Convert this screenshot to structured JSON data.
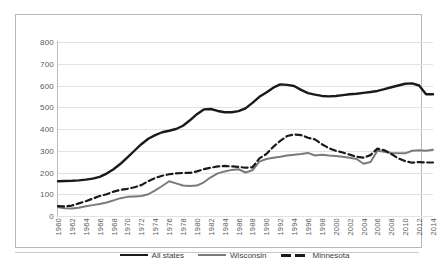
{
  "chart_data": {
    "type": "line",
    "title": "",
    "subtitle": "",
    "xlabel": "",
    "ylabel": "",
    "ylim": [
      0,
      800
    ],
    "xlim": [
      1960,
      2014
    ],
    "grid": true,
    "legend_position": "bottom",
    "y_ticks": [
      "0",
      "100",
      "200",
      "300",
      "400",
      "500",
      "600",
      "700",
      "800"
    ],
    "y_tick_values": [
      0,
      100,
      200,
      300,
      400,
      500,
      600,
      700,
      800
    ],
    "categories": [
      "1960",
      "1961",
      "1962",
      "1963",
      "1964",
      "1965",
      "1966",
      "1967",
      "1968",
      "1969",
      "1970",
      "1971",
      "1972",
      "1973",
      "1974",
      "1975",
      "1976",
      "1977",
      "1978",
      "1979",
      "1980",
      "1981",
      "1982",
      "1983",
      "1984",
      "1985",
      "1986",
      "1987",
      "1988",
      "1989",
      "1990",
      "1991",
      "1992",
      "1993",
      "1994",
      "1995",
      "1996",
      "1997",
      "1998",
      "1999",
      "2000",
      "2001",
      "2002",
      "2003",
      "2004",
      "2005",
      "2006",
      "2007",
      "2008",
      "2009",
      "2010",
      "2011",
      "2012",
      "2013",
      "2014"
    ],
    "x_tick_labels": [
      "1960",
      "1962",
      "1964",
      "1966",
      "1968",
      "1970",
      "1972",
      "1974",
      "1976",
      "1978",
      "1980",
      "1982",
      "1984",
      "1986",
      "1988",
      "1990",
      "1992",
      "1994",
      "1996",
      "1998",
      "2000",
      "2002",
      "2004",
      "2006",
      "2008",
      "2010",
      "2012",
      "2014"
    ],
    "series": [
      {
        "name": "All states",
        "color": "#1a1a1a",
        "style": "solid",
        "width": 2.4,
        "values": [
          160,
          161,
          162,
          164,
          167,
          172,
          180,
          195,
          215,
          240,
          270,
          300,
          330,
          355,
          372,
          385,
          392,
          400,
          415,
          440,
          468,
          490,
          492,
          483,
          477,
          477,
          482,
          495,
          520,
          548,
          568,
          590,
          605,
          603,
          598,
          580,
          565,
          558,
          552,
          550,
          552,
          556,
          560,
          562,
          566,
          570,
          575,
          583,
          592,
          600,
          608,
          610,
          600,
          560,
          560
        ]
      },
      {
        "name": "Wisconsin",
        "color": "#7a7a7a",
        "style": "solid",
        "width": 2,
        "values": [
          40,
          36,
          34,
          38,
          45,
          50,
          55,
          62,
          72,
          82,
          88,
          90,
          92,
          100,
          118,
          138,
          160,
          150,
          140,
          138,
          140,
          155,
          178,
          196,
          205,
          212,
          215,
          200,
          210,
          250,
          262,
          268,
          272,
          278,
          282,
          285,
          290,
          278,
          282,
          278,
          276,
          272,
          268,
          262,
          240,
          248,
          300,
          295,
          290,
          288,
          288,
          300,
          302,
          300,
          305
        ]
      },
      {
        "name": "Minnesota",
        "color": "#1a1a1a",
        "style": "dashed",
        "width": 2.2,
        "values": [
          45,
          44,
          48,
          58,
          68,
          80,
          92,
          100,
          112,
          120,
          125,
          132,
          142,
          160,
          175,
          185,
          192,
          196,
          198,
          198,
          205,
          215,
          222,
          228,
          230,
          228,
          226,
          222,
          224,
          265,
          285,
          318,
          345,
          368,
          375,
          372,
          360,
          352,
          330,
          312,
          300,
          292,
          282,
          272,
          268,
          280,
          310,
          302,
          285,
          265,
          252,
          245,
          248,
          246,
          246
        ]
      }
    ]
  },
  "legend": {
    "items": [
      {
        "label": "All states",
        "swatch": "solid-black-line-swatch"
      },
      {
        "label": "Wisconsin",
        "swatch": "solid-gray-line-swatch"
      },
      {
        "label": "Minnesota",
        "swatch": "dashed-black-line-swatch"
      }
    ]
  },
  "colors": {
    "all_states": "#1a1a1a",
    "wisconsin": "#7a7a7a",
    "minnesota": "#1a1a1a",
    "gridline": "#e2e2e2",
    "frame": "#b8b8b8",
    "tick_text": "#5a5a5a"
  }
}
